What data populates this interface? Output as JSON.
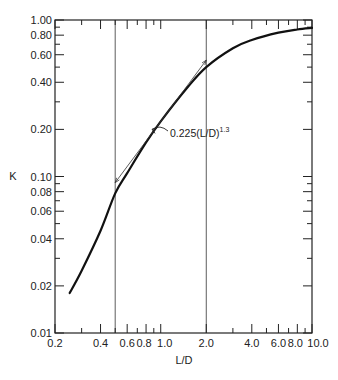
{
  "chart_data": {
    "type": "line",
    "title": "",
    "xlabel": "L/D",
    "ylabel": "K",
    "xscale": "log",
    "yscale": "log",
    "xlim": [
      0.2,
      10.0
    ],
    "ylim": [
      0.01,
      1.0
    ],
    "grid": false,
    "x_ticks": [
      0.2,
      0.4,
      0.6,
      0.8,
      1.0,
      2.0,
      4.0,
      6.0,
      8.0,
      10.0
    ],
    "x_tick_labels": [
      "0.2",
      "0.4",
      "0.6",
      "0.8",
      "1.0",
      "2.0",
      "4.0",
      "6.0",
      "8.0",
      "10.0"
    ],
    "y_ticks": [
      0.01,
      0.02,
      0.04,
      0.06,
      0.08,
      0.1,
      0.2,
      0.4,
      0.6,
      0.8,
      1.0
    ],
    "y_tick_labels": [
      "0.01",
      "0.02",
      "0.04",
      "0.06",
      "0.08",
      "0.10",
      "0.20",
      "0.40",
      "0.60",
      "0.80",
      "1.00"
    ],
    "vertical_reference_lines": [
      0.5,
      2.0
    ],
    "series": [
      {
        "name": "K curve",
        "style": "thick",
        "x": [
          0.25,
          0.3,
          0.4,
          0.5,
          0.6,
          0.8,
          1.0,
          1.5,
          2.0,
          3.0,
          4.0,
          6.0,
          8.0,
          10.0
        ],
        "values": [
          0.018,
          0.025,
          0.045,
          0.078,
          0.105,
          0.165,
          0.225,
          0.37,
          0.5,
          0.66,
          0.745,
          0.83,
          0.87,
          0.89
        ]
      },
      {
        "name": "0.225(L/D)^1.3",
        "style": "thin",
        "x": [
          0.5,
          2.0
        ],
        "values": [
          0.0914,
          0.554
        ]
      }
    ],
    "annotations": [
      {
        "text": "0.225(L/D)",
        "superscript": "1.3",
        "arrow_to": [
          0.85,
          0.2
        ]
      }
    ]
  }
}
